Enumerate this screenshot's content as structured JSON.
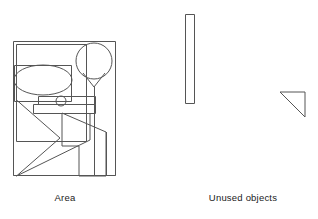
{
  "page": {
    "background_color": "#ffffff",
    "stroke_color": "#555555",
    "text_color": "#1a1a1a",
    "width": 318,
    "height": 219
  },
  "captions": {
    "area_label": "Area",
    "unused_label": "Unused objects"
  },
  "area_panel": {
    "name": "area-panel",
    "bounds": {
      "x": 13,
      "y": 41,
      "width": 103,
      "height": 135
    },
    "shapes": [
      {
        "name": "outer-frame-rect",
        "type": "rect",
        "x": 13,
        "y": 41,
        "width": 103,
        "height": 135
      },
      {
        "name": "inner-top-left-rect",
        "type": "rect",
        "x": 16,
        "y": 44,
        "width": 71,
        "height": 98
      },
      {
        "name": "ellipse-shape",
        "type": "ellipse",
        "cx": 43,
        "cy": 80,
        "rx": 29,
        "ry": 15
      },
      {
        "name": "ellipse-backing-rect",
        "type": "rect",
        "x": 14,
        "y": 65,
        "width": 58,
        "height": 37
      },
      {
        "name": "circle-large-shape",
        "type": "circle",
        "cx": 94,
        "cy": 61,
        "r": 18
      },
      {
        "name": "balloon-tail-polyline",
        "type": "polyline",
        "points": "84,74 94,87 104,74"
      },
      {
        "name": "balloon-stem-line",
        "type": "line",
        "x1": 94,
        "y1": 87,
        "x2": 94,
        "y2": 176
      },
      {
        "name": "circle-small-shape",
        "type": "circle",
        "cx": 61,
        "cy": 101,
        "r": 5
      },
      {
        "name": "bar-upper-rect",
        "type": "rect",
        "x": 38,
        "y": 97,
        "width": 58,
        "height": 7
      },
      {
        "name": "bar-lower-rect",
        "type": "rect",
        "x": 33,
        "y": 104,
        "width": 63,
        "height": 9
      },
      {
        "name": "zigzag-arrow-upper-polyline",
        "type": "polyline",
        "points": "16,100 60,138 16,176"
      },
      {
        "name": "zigzag-arrow-lower-polyline",
        "type": "polyline",
        "points": "16,176 90,140 90,113"
      },
      {
        "name": "chevron-block-polygon",
        "type": "polygon",
        "points": "62,113 106,132 106,176 79,176 79,146 62,146"
      },
      {
        "name": "vertical-divider-line",
        "type": "line",
        "x1": 106,
        "y1": 132,
        "x2": 106,
        "y2": 176
      },
      {
        "name": "bottom-baseline-line",
        "type": "line",
        "x1": 13,
        "y1": 176,
        "x2": 116,
        "y2": 176
      }
    ]
  },
  "unused_panel": {
    "name": "unused-objects-panel",
    "shapes": [
      {
        "name": "unused-tall-rectangle",
        "type": "rect",
        "x": 185,
        "y": 14,
        "width": 9,
        "height": 90
      },
      {
        "name": "unused-right-triangle",
        "type": "polygon",
        "points": "280,92 305,92 305,117"
      }
    ]
  }
}
